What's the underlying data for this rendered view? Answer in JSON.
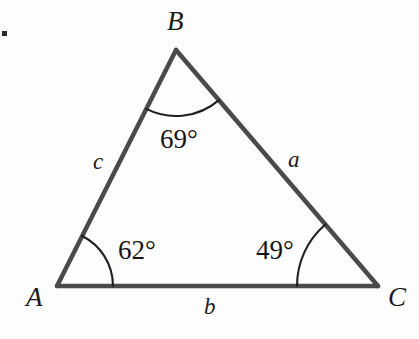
{
  "figure": {
    "type": "triangle-diagram",
    "background_color": "#fdfdfd",
    "stroke_color": "#4a4a4a",
    "arc_color": "#1f1f1f",
    "text_color": "#141414"
  },
  "vertices": [
    {
      "name": "A",
      "label": "A",
      "x": 57,
      "y": 286,
      "label_x": 26,
      "label_y": 284
    },
    {
      "name": "B",
      "label": "B",
      "x": 176,
      "y": 50,
      "label_x": 167,
      "label_y": 8
    },
    {
      "name": "C",
      "label": "C",
      "x": 378,
      "y": 286,
      "label_x": 388,
      "label_y": 284
    }
  ],
  "sides": [
    {
      "name": "a",
      "label": "a",
      "opposite_vertex": "A",
      "from": "B",
      "to": "C",
      "label_x": 288,
      "label_y": 148
    },
    {
      "name": "b",
      "label": "b",
      "opposite_vertex": "B",
      "from": "A",
      "to": "C",
      "label_x": 204,
      "label_y": 295
    },
    {
      "name": "c",
      "label": "c",
      "opposite_vertex": "C",
      "from": "A",
      "to": "B",
      "label_x": 93,
      "label_y": 150
    }
  ],
  "angles": [
    {
      "vertex": "A",
      "label": "62°",
      "value": 62,
      "unit": "degrees",
      "arc_radius": 56,
      "label_x": 118,
      "label_y": 237
    },
    {
      "vertex": "B",
      "label": "69°",
      "value": 69,
      "unit": "degrees",
      "arc_radius": 66,
      "label_x": 160,
      "label_y": 126
    },
    {
      "vertex": "C",
      "label": "49°",
      "value": 49,
      "unit": "degrees",
      "arc_radius": 81,
      "label_x": 256,
      "label_y": 237
    }
  ],
  "artifacts": {
    "list_marker": "."
  }
}
